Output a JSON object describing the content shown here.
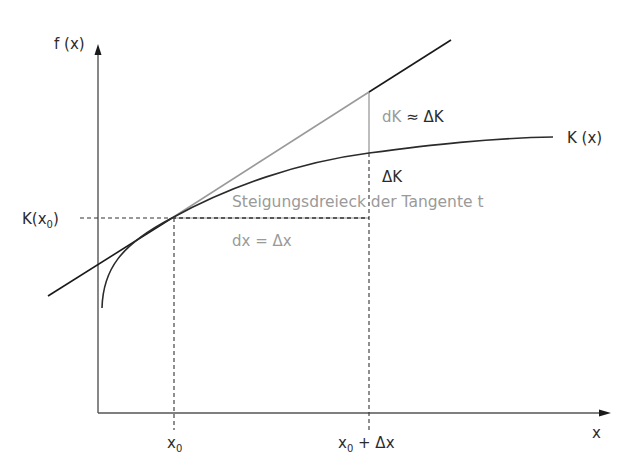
{
  "colors": {
    "axis": "#555555",
    "curve": "#2b2b2b",
    "tangent": "#1a1a1a",
    "tangent_segment": "#9a9a9a",
    "guide_dashed": "#333333",
    "gray_text": "#9a9a9a",
    "dark_text": "#2b2b2b"
  },
  "axes": {
    "y_label": "f (x)",
    "x_label": "x"
  },
  "curve": {
    "label": "K (x)"
  },
  "tangent": {
    "label": "Steigungsdreieck der Tangente t"
  },
  "labels": {
    "k_x0_main": "K(x",
    "k_x0_sub": "0",
    "k_x0_close": ")",
    "x0_main": "x",
    "x0_sub": "0",
    "x0dx_main": "x",
    "x0dx_sub": "0",
    "x0dx_rest": " + Δx",
    "dk_left": "dK ",
    "dk_right": "≈ ΔK",
    "delta_k": "ΔK",
    "dx": "dx = Δx"
  }
}
